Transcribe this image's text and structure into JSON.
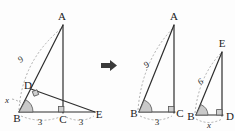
{
  "figure": {
    "arrow": {
      "name": "transformation-arrow",
      "glyph": "➜"
    },
    "left_diagram": {
      "name": "composite-triangle-ABE-with-altitude-BD",
      "vertices": [
        {
          "id": "A",
          "label": "A",
          "x": 62,
          "y": 20
        },
        {
          "id": "D",
          "label": "D",
          "x": 28,
          "y": 89
        },
        {
          "id": "B",
          "label": "B",
          "x": 17,
          "y": 114
        },
        {
          "id": "C",
          "label": "C",
          "x": 63,
          "y": 115
        },
        {
          "id": "E",
          "label": "E",
          "x": 97,
          "y": 114
        }
      ],
      "measures": [
        {
          "id": "hyp-AB",
          "label": "9",
          "x": 22,
          "y": 58
        },
        {
          "id": "base-BC",
          "label": "3",
          "x": 40,
          "y": 124
        },
        {
          "id": "base-CE",
          "label": "3",
          "x": 80,
          "y": 124
        },
        {
          "id": "angle-B",
          "label": "x",
          "x": 7,
          "y": 101
        }
      ]
    },
    "right_diagram_1": {
      "name": "triangle-ABC",
      "vertices": [
        {
          "id": "A",
          "label": "A",
          "x": 174,
          "y": 20
        },
        {
          "id": "B",
          "label": "B",
          "x": 137,
          "y": 114
        },
        {
          "id": "C",
          "label": "C",
          "x": 176,
          "y": 114
        }
      ],
      "measures": [
        {
          "id": "hyp-AB",
          "label": "9",
          "x": 148,
          "y": 63
        },
        {
          "id": "base-BC",
          "label": "3",
          "x": 157,
          "y": 124
        }
      ]
    },
    "right_diagram_2": {
      "name": "triangle-BED",
      "vertices": [
        {
          "id": "E",
          "label": "E",
          "x": 222,
          "y": 47
        },
        {
          "id": "B",
          "label": "B",
          "x": 194,
          "y": 117
        },
        {
          "id": "D",
          "label": "D",
          "x": 228,
          "y": 117
        }
      ],
      "measures": [
        {
          "id": "hyp-BE",
          "label": "6",
          "x": 202,
          "y": 81
        },
        {
          "id": "base-BD",
          "label": "x",
          "x": 209,
          "y": 127
        }
      ]
    },
    "colors": {
      "line": "#2e2e2e",
      "dashed": "#9a9a9a",
      "marker_fill": "#cfcfcf",
      "text": "#1a1a1a",
      "background": "#fdfdfd"
    }
  }
}
